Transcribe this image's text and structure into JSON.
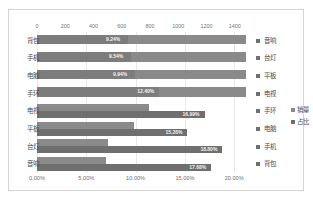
{
  "chart_data": {
    "type": "bar",
    "title": "",
    "orientation": "horizontal",
    "grid": true,
    "legend_position": "right",
    "legend": [
      "销量",
      "占比"
    ],
    "top_axis": {
      "label": "销量",
      "ticks": [
        "0",
        "200",
        "400",
        "600",
        "800",
        "1000",
        "1200",
        "1400"
      ],
      "min": 0,
      "max": 1500
    },
    "bottom_axis": {
      "label": "占比",
      "ticks": [
        "0.00%",
        "5.00%",
        "10.00%",
        "15.00%",
        "20.00%"
      ],
      "min": 0,
      "max": 21.5
    },
    "left_categories": [
      "背包",
      "手机",
      "电脑",
      "手环",
      "电视",
      "平板",
      "台灯",
      "音响"
    ],
    "right_categories": [
      "音响",
      "台灯",
      "平板",
      "电视",
      "手环",
      "电脑",
      "手机",
      "背包"
    ],
    "series": [
      {
        "name": "销量",
        "categories": [
          "背包",
          "手机",
          "电脑",
          "手环",
          "电视",
          "平板",
          "台灯",
          "音响"
        ],
        "values": [
          1480,
          1480,
          1480,
          1480,
          790,
          685,
          500,
          485
        ]
      },
      {
        "name": "占比",
        "categories": [
          "音响",
          "台灯",
          "平板",
          "电视",
          "手环",
          "电脑",
          "手机",
          "背包"
        ],
        "values": [
          9.24,
          9.54,
          9.94,
          12.4,
          16.99,
          15.26,
          18.8,
          17.68
        ],
        "data_labels": [
          "9.24%",
          "9.54%",
          "9.94%",
          "12.40%",
          "16.99%",
          "15.26%",
          "18.80%",
          "17.68%"
        ]
      }
    ],
    "rows": [
      {
        "left_label": "背包",
        "right_label": "音响",
        "sales": 1480,
        "pct": 9.24,
        "pct_label": "9.24%",
        "merged": true
      },
      {
        "left_label": "手机",
        "right_label": "台灯",
        "sales": 1480,
        "pct": 9.54,
        "pct_label": "9.54%",
        "merged": true
      },
      {
        "left_label": "电脑",
        "right_label": "平板",
        "sales": 1480,
        "pct": 9.94,
        "pct_label": "9.94%",
        "merged": true
      },
      {
        "left_label": "手环",
        "right_label": "电视",
        "sales": 1480,
        "pct": 12.4,
        "pct_label": "12.40%",
        "merged": true
      },
      {
        "left_label": "电视",
        "right_label": "手环",
        "sales": 790,
        "pct": 16.99,
        "pct_label": "16.99%",
        "merged": false
      },
      {
        "left_label": "平板",
        "right_label": "电脑",
        "sales": 685,
        "pct": 15.26,
        "pct_label": "15.26%",
        "merged": false
      },
      {
        "left_label": "台灯",
        "right_label": "手机",
        "sales": 500,
        "pct": 18.8,
        "pct_label": "18.80%",
        "merged": false
      },
      {
        "left_label": "音响",
        "right_label": "背包",
        "sales": 485,
        "pct": 17.68,
        "pct_label": "17.68%",
        "merged": false
      }
    ],
    "colors": {
      "series_sales": "#8a8a8a",
      "series_pct": "#6f6f6f",
      "gridline": "#e8e8e8",
      "border": "#d4d4d4",
      "axis_text": "#737373",
      "category_text": "#4a4a4a",
      "data_label_text": "#f2f2f2"
    }
  }
}
